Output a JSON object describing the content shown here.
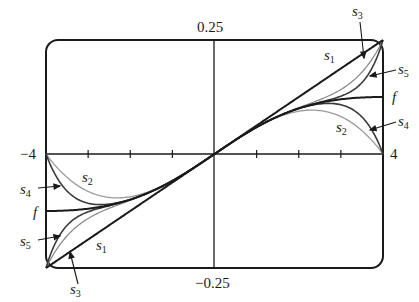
{
  "chart_data": {
    "type": "line",
    "title": "",
    "xlabel": "",
    "ylabel": "",
    "xlim": [
      -4,
      4
    ],
    "ylim": [
      -0.25,
      0.25
    ],
    "x_tick_labels": [
      "-4",
      "4"
    ],
    "y_tick_labels": [
      "0.25",
      "-0.25"
    ],
    "x_ticks": [
      -4,
      -3,
      -2,
      -1,
      0,
      1,
      2,
      3,
      4
    ],
    "grid": false,
    "legend": "inline labels with arrows",
    "function": "f(x) = x/(16+x^2)",
    "series": [
      {
        "name": "f",
        "color": "#1a1a1a",
        "width": 2.0,
        "x": [
          -4,
          -3,
          -2,
          -1,
          0,
          1,
          2,
          3,
          4
        ],
        "values": [
          -0.125,
          -0.12,
          -0.1,
          -0.0588,
          0,
          0.0588,
          0.1,
          0.12,
          0.125
        ]
      },
      {
        "name": "s1",
        "color": "#1a1a1a",
        "width": 2.0,
        "x": [
          -4,
          -3,
          -2,
          -1,
          0,
          1,
          2,
          3,
          4
        ],
        "values": [
          -0.25,
          -0.1875,
          -0.125,
          -0.0625,
          0,
          0.0625,
          0.125,
          0.1875,
          0.25
        ]
      },
      {
        "name": "s2",
        "color": "#9a9a9a",
        "width": 1.3,
        "x": [
          -4,
          -3,
          -2,
          -1,
          0,
          1,
          2,
          3,
          4
        ],
        "values": [
          0,
          -0.082,
          -0.094,
          -0.059,
          0,
          0.059,
          0.094,
          0.082,
          0
        ]
      },
      {
        "name": "s3",
        "color": "#8a8a8a",
        "width": 1.3,
        "x": [
          -4,
          -3,
          -2,
          -1,
          0,
          1,
          2,
          3,
          4
        ],
        "values": [
          -0.25,
          -0.141,
          -0.102,
          -0.059,
          0,
          0.059,
          0.102,
          0.141,
          0.25
        ]
      },
      {
        "name": "s4",
        "color": "#3a3a3a",
        "width": 1.6,
        "x": [
          -4,
          -3,
          -2,
          -1,
          0,
          1,
          2,
          3,
          4
        ],
        "values": [
          0,
          -0.108,
          -0.1,
          -0.059,
          0,
          0.059,
          0.1,
          0.108,
          0
        ]
      },
      {
        "name": "s5",
        "color": "#3a3a3a",
        "width": 1.6,
        "x": [
          -4,
          -3,
          -2,
          -1,
          0,
          1,
          2,
          3,
          4
        ],
        "values": [
          -0.25,
          -0.127,
          -0.1,
          -0.059,
          0,
          0.059,
          0.1,
          0.127,
          0.25
        ]
      }
    ]
  },
  "labels": {
    "y_top": "0.25",
    "y_bottom": "−0.25",
    "x_left": "−4",
    "x_right": "4",
    "f": "f",
    "s": "s"
  }
}
